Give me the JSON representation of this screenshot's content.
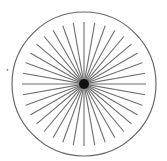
{
  "diagram": {
    "type": "radial-line-chart",
    "spoke_count": 36,
    "spoke_angle_step_deg": 10,
    "center": [
      84,
      84
    ],
    "outer_radius": 72,
    "spoke_outer_radius": 62,
    "spoke_inner_radius": 2,
    "center_dot_radius": 5,
    "colors": {
      "circle": "#6a6a6a",
      "spokes": "#6e6e6e",
      "center": "#111111",
      "background": "#ffffff"
    },
    "stray_mark": "‚"
  }
}
